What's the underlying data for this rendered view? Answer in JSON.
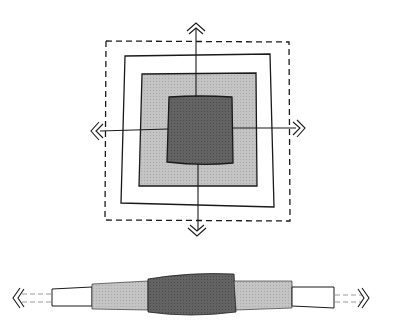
{
  "diagram": {
    "title": "",
    "colors": {
      "background": "#ffffff",
      "outline": "#1a1a1a",
      "outer_fill": "#ffffff",
      "middle_fill": "#b8b8b8",
      "core_fill": "#5c5c5c"
    },
    "top_view": {
      "layers": [
        {
          "name": "dashed-boundary",
          "style": "dashed"
        },
        {
          "name": "outer-layer",
          "fill": "white"
        },
        {
          "name": "middle-layer",
          "fill": "light-gray"
        },
        {
          "name": "core",
          "fill": "dark-gray"
        }
      ],
      "arrows": [
        "up",
        "down",
        "left",
        "right"
      ]
    },
    "side_view": {
      "segments": [
        "dashed-left",
        "white-left",
        "gray-left",
        "dark-core",
        "gray-right",
        "white-right",
        "dashed-right"
      ],
      "arrows": [
        "left",
        "right"
      ]
    }
  }
}
